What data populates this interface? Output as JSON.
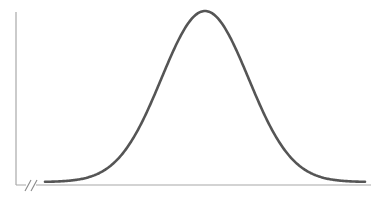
{
  "chart_data": {
    "type": "line",
    "title": "",
    "xlabel": "",
    "ylabel": "",
    "series": [
      {
        "name": "normal-curve",
        "distribution": "normal",
        "mean": 0,
        "std": 1,
        "x_range": [
          -3.7,
          3.7
        ]
      }
    ],
    "x_axis_break": true,
    "grid": false,
    "legend": false,
    "colors": {
      "curve": "#555555",
      "axes": "#a8a8a8",
      "background": "#ffffff"
    }
  },
  "layout": {
    "y_axis": {
      "x": 16,
      "y_top": 12,
      "y_bottom": 185
    },
    "x_axis": {
      "y": 185,
      "x_left": 16,
      "x_right": 371
    },
    "curve": {
      "center_x": 205,
      "peak_y": 11,
      "base_y": 182,
      "sigma_px": 43.5,
      "x_start": 45,
      "x_end": 365
    }
  }
}
